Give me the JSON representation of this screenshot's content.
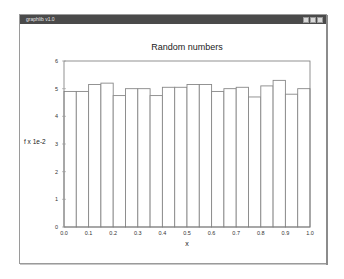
{
  "window": {
    "title": "graphlib v1.0",
    "controls": [
      "minimize",
      "maximize",
      "close"
    ]
  },
  "chart_data": {
    "type": "bar",
    "title": "Random numbers",
    "xlabel": "x",
    "ylabel": "f x 1e-2",
    "xlim": [
      0.0,
      1.0
    ],
    "ylim": [
      0,
      6
    ],
    "xticks": [
      "0.0",
      "0.1",
      "0.2",
      "0.3",
      "0.4",
      "0.5",
      "0.6",
      "0.7",
      "0.8",
      "0.9",
      "1.0"
    ],
    "yticks": [
      "0",
      "1",
      "2",
      "3",
      "4",
      "5",
      "6"
    ],
    "grid": false,
    "legend": null,
    "bin_width": 0.05,
    "categories": [
      0.0,
      0.05,
      0.1,
      0.15,
      0.2,
      0.25,
      0.3,
      0.35,
      0.4,
      0.45,
      0.5,
      0.55,
      0.6,
      0.65,
      0.7,
      0.75,
      0.8,
      0.85,
      0.9,
      0.95
    ],
    "values": [
      4.9,
      4.9,
      5.15,
      5.2,
      4.75,
      5.0,
      5.0,
      4.75,
      5.05,
      5.05,
      5.15,
      5.15,
      4.9,
      5.0,
      5.05,
      4.7,
      5.1,
      5.3,
      4.8,
      5.0
    ],
    "bar_fill": "#ffffff",
    "bar_stroke": "#888888"
  }
}
